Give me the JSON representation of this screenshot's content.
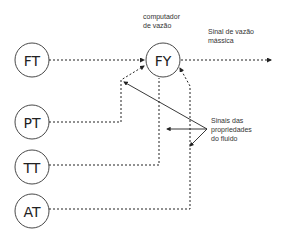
{
  "diagram": {
    "title": "",
    "nodes": [
      {
        "id": "FT",
        "label": "FT",
        "cx": 32,
        "cy": 60
      },
      {
        "id": "FY",
        "label": "FY",
        "cx": 163,
        "cy": 60
      },
      {
        "id": "PT",
        "label": "PT",
        "cx": 32,
        "cy": 122
      },
      {
        "id": "TT",
        "label": "TT",
        "cx": 32,
        "cy": 167
      },
      {
        "id": "AT",
        "label": "AT",
        "cx": 32,
        "cy": 211
      }
    ],
    "labels": {
      "fy_caption_line1": "computador",
      "fy_caption_line2": "de vazão",
      "output_line1": "Sinal de vazão",
      "output_line2": "mássica",
      "props_line1": "Sinais das",
      "props_line2": "propriedades",
      "props_line3": "do fluido"
    },
    "edges": [
      {
        "from": "FT",
        "to": "FY",
        "style": "dotted"
      },
      {
        "from": "FY",
        "to": "output",
        "style": "dotted"
      },
      {
        "from": "PT",
        "to": "FY",
        "style": "dotted"
      },
      {
        "from": "TT",
        "to": "FY",
        "style": "dotted"
      },
      {
        "from": "AT",
        "to": "FY",
        "style": "dotted"
      },
      {
        "from": "props-label",
        "to": "PT-line",
        "style": "solid"
      },
      {
        "from": "props-label",
        "to": "TT-line",
        "style": "solid"
      },
      {
        "from": "props-label",
        "to": "AT-line",
        "style": "solid"
      }
    ],
    "colors": {
      "stroke": "#222222",
      "background": "#ffffff"
    }
  }
}
